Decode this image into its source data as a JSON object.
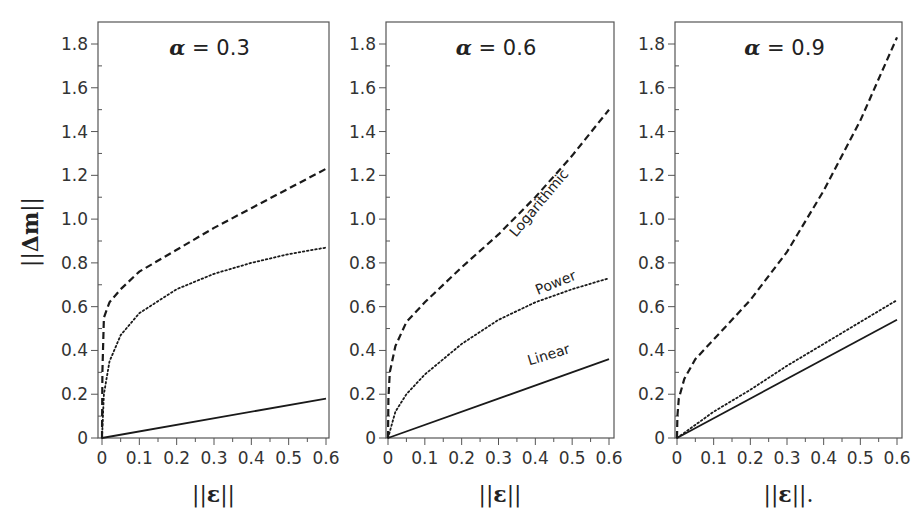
{
  "chart_data": [
    {
      "type": "line",
      "title": "α = 0.3",
      "alpha": "0.3",
      "xlabel": "||ε||",
      "ylabel": "||Δm||",
      "xlim": [
        0,
        0.6
      ],
      "ylim": [
        0,
        1.85
      ],
      "xticks": [
        "0",
        "0.1",
        "0.2",
        "0.3",
        "0.4",
        "0.5",
        "0.6"
      ],
      "yticks": [
        "0",
        "0.2",
        "0.4",
        "0.6",
        "0.8",
        "1.0",
        "1.2",
        "1.4",
        "1.6",
        "1.8"
      ],
      "grid": false,
      "series": [
        {
          "name": "Logarithmic",
          "style": "dashed",
          "x": [
            0,
            0.001,
            0.005,
            0.02,
            0.05,
            0.1,
            0.2,
            0.3,
            0.4,
            0.5,
            0.6
          ],
          "y": [
            0,
            0.3,
            0.55,
            0.62,
            0.68,
            0.76,
            0.86,
            0.96,
            1.05,
            1.14,
            1.23
          ]
        },
        {
          "name": "Power",
          "style": "dotted",
          "x": [
            0,
            0.005,
            0.02,
            0.05,
            0.1,
            0.2,
            0.3,
            0.4,
            0.5,
            0.6
          ],
          "y": [
            0,
            0.2,
            0.35,
            0.47,
            0.57,
            0.68,
            0.75,
            0.8,
            0.84,
            0.87
          ]
        },
        {
          "name": "Linear",
          "style": "solid",
          "x": [
            0,
            0.6
          ],
          "y": [
            0,
            0.18
          ]
        }
      ],
      "curve_labels": []
    },
    {
      "type": "line",
      "title": "α = 0.6",
      "alpha": "0.6",
      "xlabel": "||ε||",
      "ylabel": "",
      "xlim": [
        0,
        0.6
      ],
      "ylim": [
        0,
        1.85
      ],
      "xticks": [
        "0",
        "0.1",
        "0.2",
        "0.3",
        "0.4",
        "0.5",
        "0.6"
      ],
      "yticks": [
        "0",
        "0.2",
        "0.4",
        "0.6",
        "0.8",
        "1.0",
        "1.2",
        "1.4",
        "1.6",
        "1.8"
      ],
      "grid": false,
      "series": [
        {
          "name": "Logarithmic",
          "style": "dashed",
          "x": [
            0,
            0.001,
            0.005,
            0.02,
            0.05,
            0.1,
            0.2,
            0.3,
            0.4,
            0.5,
            0.6
          ],
          "y": [
            0,
            0.18,
            0.3,
            0.42,
            0.53,
            0.62,
            0.78,
            0.93,
            1.1,
            1.29,
            1.5
          ]
        },
        {
          "name": "Power",
          "style": "dotted",
          "x": [
            0,
            0.02,
            0.05,
            0.1,
            0.2,
            0.3,
            0.4,
            0.5,
            0.6
          ],
          "y": [
            0,
            0.12,
            0.2,
            0.29,
            0.43,
            0.54,
            0.62,
            0.68,
            0.73
          ]
        },
        {
          "name": "Linear",
          "style": "solid",
          "x": [
            0,
            0.6
          ],
          "y": [
            0,
            0.36
          ]
        }
      ],
      "curve_labels": [
        {
          "text": "Logarithmic",
          "x": 0.42,
          "y": 1.06,
          "angle": -50
        },
        {
          "text": "Power",
          "x": 0.46,
          "y": 0.69,
          "angle": -22
        },
        {
          "text": "Linear",
          "x": 0.44,
          "y": 0.36,
          "angle": -17
        }
      ]
    },
    {
      "type": "line",
      "title": "α = 0.9",
      "alpha": "0.9",
      "xlabel": "||ε||.",
      "ylabel": "",
      "xlim": [
        0,
        0.6
      ],
      "ylim": [
        0,
        1.85
      ],
      "xticks": [
        "0",
        "0.1",
        "0.2",
        "0.3",
        "0.4",
        "0.5",
        "0.6"
      ],
      "yticks": [
        "0",
        "0.2",
        "0.4",
        "0.6",
        "0.8",
        "1.0",
        "1.2",
        "1.4",
        "1.6",
        "1.8"
      ],
      "grid": false,
      "series": [
        {
          "name": "Logarithmic",
          "style": "dashed",
          "x": [
            0,
            0.001,
            0.005,
            0.02,
            0.05,
            0.1,
            0.2,
            0.3,
            0.4,
            0.5,
            0.6
          ],
          "y": [
            0,
            0.1,
            0.18,
            0.27,
            0.36,
            0.45,
            0.63,
            0.85,
            1.13,
            1.45,
            1.83
          ]
        },
        {
          "name": "Power",
          "style": "dotted",
          "x": [
            0,
            0.05,
            0.1,
            0.2,
            0.3,
            0.4,
            0.5,
            0.6
          ],
          "y": [
            0,
            0.06,
            0.12,
            0.22,
            0.33,
            0.43,
            0.53,
            0.63
          ]
        },
        {
          "name": "Linear",
          "style": "solid",
          "x": [
            0,
            0.6
          ],
          "y": [
            0,
            0.54
          ]
        }
      ],
      "curve_labels": []
    }
  ],
  "figure": {
    "ylabel_text": "||Δm||",
    "title_prefix": "α",
    "panels_layout": [
      {
        "frame_left": 98,
        "frame_right": 329,
        "x0": 102,
        "x1": 326
      },
      {
        "frame_left": 386,
        "frame_right": 614,
        "x0": 388,
        "x1": 609
      },
      {
        "frame_left": 675,
        "frame_right": 902,
        "x0": 677,
        "x1": 897
      }
    ],
    "frame_top": 22,
    "y0_px": 438,
    "y18_px": 44
  }
}
